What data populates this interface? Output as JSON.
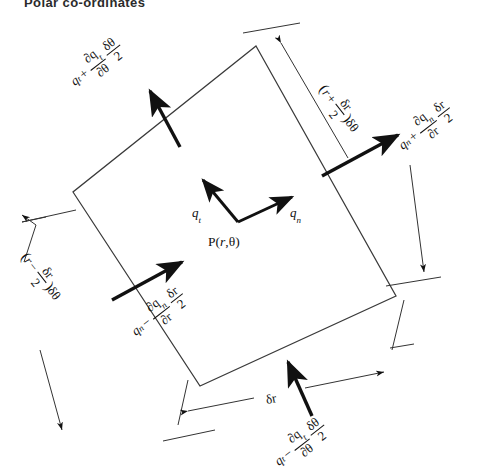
{
  "figure": {
    "title": "Polar co-ordinates",
    "background_color": "#ffffff",
    "ink_color": "#111111"
  },
  "point": {
    "label_p": "P(",
    "label_r": "r",
    "label_comma": ",",
    "label_theta": "θ",
    "label_close": ")",
    "full": "P(r,θ)"
  },
  "vectors": {
    "tangential": {
      "symbol": "q",
      "subscript": "t",
      "full": "q_t"
    },
    "normal": {
      "symbol": "q",
      "subscript": "n",
      "full": "q_n"
    }
  },
  "flux_labels": {
    "top_left": {
      "lead": "q",
      "lead_sub": "t",
      "operator": "+",
      "frac1_num_partial": "∂q",
      "frac1_num_sub": "t",
      "frac1_den_partial": "∂θ",
      "frac2_num": "δθ",
      "frac2_den": "2",
      "full": "q_t + (∂q_t/∂θ)(δθ/2)",
      "rotation_deg": -38
    },
    "right": {
      "lead": "q",
      "lead_sub": "n",
      "operator": "+",
      "frac1_num_partial": "∂q",
      "frac1_num_sub": "n",
      "frac1_den_partial": "∂r",
      "frac2_num": "δr",
      "frac2_den": "2",
      "full": "q_n + (∂q_n/∂r)(δr/2)",
      "rotation_deg": -38
    },
    "bottom_left": {
      "lead": "q",
      "lead_sub": "n",
      "operator": "−",
      "frac1_num_partial": "∂q",
      "frac1_num_sub": "n",
      "frac1_den_partial": "∂r",
      "frac2_num": "δr",
      "frac2_den": "2",
      "full": "q_n − (∂q_n/∂r)(δr/2)",
      "rotation_deg": -38
    },
    "bottom": {
      "lead": "q",
      "lead_sub": "t",
      "operator": "−",
      "frac1_num_partial": "∂q",
      "frac1_num_sub": "t",
      "frac1_den_partial": "∂θ",
      "frac2_num": "δθ",
      "frac2_den": "2",
      "full": "q_t − (∂q_t/∂θ)(δθ/2)",
      "rotation_deg": -38
    }
  },
  "dimension_labels": {
    "outer_arc": {
      "open": "(",
      "var": "r",
      "operator": "+",
      "frac_num": "δr",
      "frac_den": "2",
      "close": ")",
      "suffix": "δθ",
      "full": "(r + δr/2)δθ",
      "rotation_deg": 52
    },
    "inner_arc": {
      "open": "(",
      "var": "r",
      "operator": "−",
      "frac_num": "δr",
      "frac_den": "2",
      "close": ")",
      "suffix": "δθ",
      "full": "(r − δr/2)δθ",
      "rotation_deg": 52
    },
    "radial": {
      "full": "δr",
      "rotation_deg": -38
    }
  },
  "geometry": {
    "element_corners": [
      {
        "name": "top",
        "x": 256,
        "y": 46
      },
      {
        "name": "right",
        "x": 396,
        "y": 296
      },
      {
        "name": "bottom",
        "x": 200,
        "y": 386
      },
      {
        "name": "left",
        "x": 73,
        "y": 192
      }
    ],
    "point_position": {
      "x": 238,
      "y": 222
    },
    "shape": "quadrilateral-polar-element"
  }
}
